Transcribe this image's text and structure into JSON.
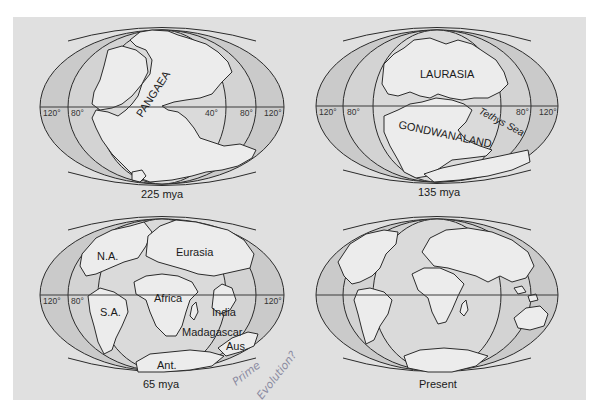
{
  "figure": {
    "background_color": "#e0e0e0",
    "land_color": "#ececec",
    "ocean_color": "#cacaca",
    "outline_color": "#2b2b2b"
  },
  "maps": [
    {
      "id": "225mya",
      "caption": "225 mya",
      "labels": {
        "supercontinent": "PANGAEA"
      },
      "degrees": {
        "left_120": "120°",
        "left_80": "80°",
        "right_40": "40°",
        "right_80": "80°",
        "right_120": "120°"
      }
    },
    {
      "id": "135mya",
      "caption": "135 mya",
      "labels": {
        "north": "LAURASIA",
        "south": "GONDWANALAND",
        "sea": "Tethys Sea"
      },
      "degrees": {
        "left_120": "120°",
        "left_80": "80°",
        "right_80": "80°",
        "right_120": "120°"
      }
    },
    {
      "id": "65mya",
      "caption": "65 mya",
      "labels": {
        "na": "N.A.",
        "eurasia": "Eurasia",
        "sa": "S.A.",
        "africa": "Africa",
        "india": "India",
        "madagascar": "Madagascar",
        "aus": "Aus.",
        "ant": "Ant."
      },
      "degrees": {
        "left_120": "120°",
        "left_80": "80°",
        "right_120": "120°"
      }
    },
    {
      "id": "present",
      "caption": "Present",
      "labels": {},
      "degrees": {}
    }
  ],
  "annotation": {
    "handwritten_line1": "Prime",
    "handwritten_line2": "Evolution?"
  }
}
